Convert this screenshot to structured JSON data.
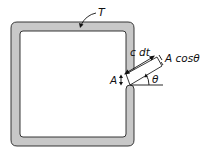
{
  "diagram": {
    "type": "enclosure-with-aperture",
    "labels": {
      "wall": "T",
      "beam_length": "c dt",
      "beam_width": "A cosθ",
      "aperture": "A",
      "angle": "θ"
    },
    "colors": {
      "wall_fill": "#c8c8c8",
      "stroke": "#222222",
      "background": "#ffffff"
    }
  }
}
